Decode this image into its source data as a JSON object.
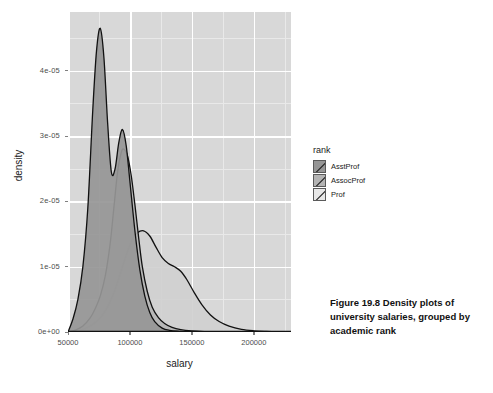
{
  "figure": {
    "caption": "Figure 19.8   Density plots of university salaries, grouped by academic rank",
    "background_color": "#ffffff",
    "panel_color": "#d8d8d8",
    "gridline_color": "#ffffff"
  },
  "chart_data": {
    "type": "area",
    "title": "",
    "xlabel": "salary",
    "ylabel": "density",
    "xlim": [
      50000,
      230000
    ],
    "ylim": [
      0,
      4.9e-05
    ],
    "grid": true,
    "legend_position": "right",
    "legend_title": "rank",
    "x_ticks": [
      50000,
      100000,
      150000,
      200000
    ],
    "x_tick_labels": [
      "50000",
      "100000",
      "150000",
      "200000"
    ],
    "y_ticks": [
      0,
      1e-05,
      2e-05,
      3e-05,
      4e-05
    ],
    "y_tick_labels": [
      "0e+00",
      "1e-05",
      "2e-05",
      "3e-05",
      "4e-05"
    ],
    "x_minor_ticks": [
      75000,
      125000,
      175000,
      225000
    ],
    "y_minor_ticks": [
      5e-06,
      1.5e-05,
      2.5e-05,
      3.5e-05,
      4.5e-05
    ],
    "series": [
      {
        "name": "AsstProf",
        "fill": "#969696",
        "line": "#111111",
        "peak_x": 76000,
        "peak_y": 4.65e-05,
        "x": [
          50000,
          54000,
          58000,
          62000,
          66000,
          70000,
          73000,
          76000,
          79000,
          82000,
          85000,
          88000,
          91000,
          94000,
          97000,
          100000,
          104000,
          108000,
          112000,
          116000,
          120000,
          126000,
          132000,
          140000,
          150000,
          165000,
          185000,
          205000,
          230000
        ],
        "y": [
          0.0,
          2e-06,
          5e-06,
          1e-05,
          1.9e-05,
          3.4e-05,
          4.3e-05,
          4.65e-05,
          4.2e-05,
          3.2e-05,
          2.45e-05,
          2.5e-05,
          2.9e-05,
          3.1e-05,
          2.85e-05,
          2.3e-05,
          1.55e-05,
          9.5e-06,
          5.5e-06,
          3e-06,
          1.6e-06,
          6e-07,
          2.5e-07,
          1e-07,
          0.0,
          0.0,
          0.0,
          0.0,
          0.0
        ]
      },
      {
        "name": "AssocProf",
        "fill": "#b4b4b4",
        "line": "#111111",
        "peak_x": 95000,
        "peak_y": 2.8e-05,
        "x": [
          50000,
          56000,
          62000,
          68000,
          72000,
          76000,
          80000,
          84000,
          87000,
          90000,
          93000,
          95000,
          98000,
          101000,
          104000,
          107000,
          110000,
          114000,
          118000,
          123000,
          128000,
          134000,
          141000,
          150000,
          160000,
          172000,
          185000,
          200000,
          230000
        ],
        "y": [
          0.0,
          3e-07,
          9e-07,
          2.2e-06,
          3.6e-06,
          5.5e-06,
          8.5e-06,
          1.35e-05,
          1.9e-05,
          2.45e-05,
          2.75e-05,
          2.8e-05,
          2.7e-05,
          2.4e-05,
          1.95e-05,
          1.45e-05,
          1e-05,
          6.2e-06,
          3.8e-06,
          2.2e-06,
          1.3e-06,
          7e-07,
          3.5e-07,
          1.5e-07,
          5e-08,
          0.0,
          0.0,
          0.0,
          0.0
        ]
      },
      {
        "name": "Prof",
        "fill": "#d0d0d0",
        "line": "#111111",
        "peak_x": 111000,
        "peak_y": 1.55e-05,
        "x": [
          50000,
          58000,
          66000,
          74000,
          80000,
          86000,
          92000,
          97000,
          102000,
          106000,
          111000,
          116000,
          121000,
          126000,
          131000,
          136000,
          141000,
          146000,
          152000,
          158000,
          165000,
          172000,
          180000,
          190000,
          200000,
          210000,
          220000,
          230000
        ],
        "y": [
          0.0,
          2e-07,
          7e-07,
          1.8e-06,
          3.2e-06,
          5.5e-06,
          8.8e-06,
          1.18e-05,
          1.42e-05,
          1.52e-05,
          1.55e-05,
          1.47e-05,
          1.3e-05,
          1.14e-05,
          1.05e-05,
          1e-05,
          9.3e-06,
          8e-06,
          6e-06,
          4.2e-06,
          2.6e-06,
          1.6e-06,
          9e-07,
          4e-07,
          1.8e-07,
          8e-08,
          3e-08,
          0.0
        ]
      }
    ]
  },
  "legend": {
    "title": "rank",
    "items": [
      {
        "label": "AsstProf",
        "color": "#969696"
      },
      {
        "label": "AssocProf",
        "color": "#b4b4b4"
      },
      {
        "label": "Prof",
        "color": "#e8e8e8"
      }
    ]
  }
}
